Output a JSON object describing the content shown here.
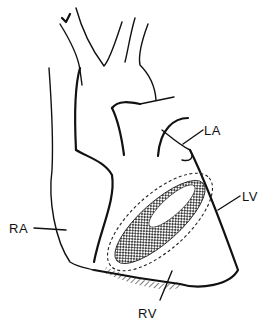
{
  "diagram": {
    "labels": [
      {
        "id": "la",
        "text": "LA"
      },
      {
        "id": "lv",
        "text": "LV"
      },
      {
        "id": "ra",
        "text": "RA"
      },
      {
        "id": "rv",
        "text": "RV"
      }
    ],
    "colors": {
      "ink": "#111111",
      "background": "#ffffff"
    }
  }
}
